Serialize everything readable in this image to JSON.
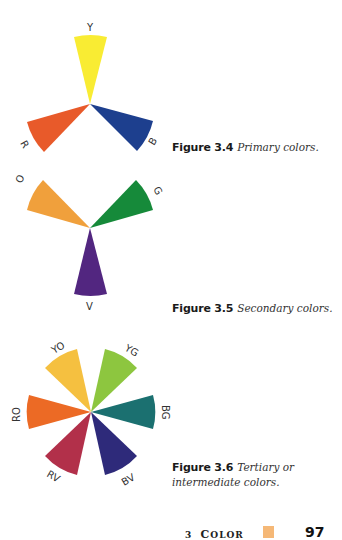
{
  "figures": [
    {
      "id": "fig-3-4",
      "number": "Figure 3.4",
      "caption": "Primary colors.",
      "wedges": [
        {
          "label": "Y",
          "color": "#f9ec33"
        },
        {
          "label": "B",
          "color": "#1d3f8e"
        },
        {
          "label": "R",
          "color": "#e85a2a"
        }
      ]
    },
    {
      "id": "fig-3-5",
      "number": "Figure 3.5",
      "caption": "Secondary colors.",
      "wedges": [
        {
          "label": "G",
          "color": "#168a3a"
        },
        {
          "label": "V",
          "color": "#522680"
        },
        {
          "label": "O",
          "color": "#f0a03c"
        }
      ]
    },
    {
      "id": "fig-3-6",
      "number": "Figure 3.6",
      "caption": "Tertiary or intermediate colors.",
      "wedges": [
        {
          "label": "YG",
          "color": "#8dc63f"
        },
        {
          "label": "BG",
          "color": "#1b7070"
        },
        {
          "label": "BV",
          "color": "#2e2a7a"
        },
        {
          "label": "RV",
          "color": "#b2304a"
        },
        {
          "label": "RO",
          "color": "#ec6a25"
        },
        {
          "label": "YO",
          "color": "#f5c040"
        }
      ]
    }
  ],
  "footer": {
    "chapter_number": "3",
    "chapter_title_first": "C",
    "chapter_title_rest": "OLOR",
    "swatch_color": "#f5b877",
    "page_number": "97"
  }
}
